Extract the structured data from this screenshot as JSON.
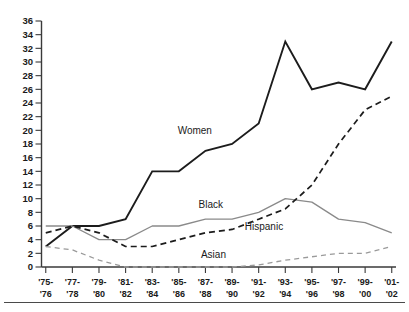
{
  "chart_data": {
    "type": "line",
    "title": "",
    "subtitle": "",
    "xlabel": "",
    "ylabel": "",
    "ylim": [
      0,
      36
    ],
    "ytick_step": 2,
    "grid": false,
    "legend_position": "inline-annotations",
    "categories": [
      "'75-\n'76",
      "'77-\n'78",
      "'79-\n'80",
      "'81-\n'82",
      "'83-\n'84",
      "'85-\n'86",
      "'87-\n'88",
      "'89-\n'90",
      "'91-\n'92",
      "'93-\n'94",
      "'95-\n'96",
      "'97-\n'98",
      "'99-\n'00",
      "'01-\n'02"
    ],
    "x_tick_top": [
      "'75-",
      "'77-",
      "'79-",
      "'81-",
      "'83-",
      "'85-",
      "'87-",
      "'89-",
      "'91-",
      "'93-",
      "'95-",
      "'97-",
      "'99-",
      "'01-"
    ],
    "x_tick_bottom": [
      "'76",
      "'78",
      "'80",
      "'82",
      "'84",
      "'86",
      "'88",
      "'90",
      "'92",
      "'94",
      "'96",
      "'98",
      "'00",
      "'02"
    ],
    "y_tick_labels": [
      "0",
      "2",
      "4",
      "6",
      "8",
      "10",
      "12",
      "14",
      "16",
      "18",
      "20",
      "22",
      "24",
      "26",
      "28",
      "30",
      "32",
      "34",
      "36"
    ],
    "y_tick_values": [
      0,
      2,
      4,
      6,
      8,
      10,
      12,
      14,
      16,
      18,
      20,
      22,
      24,
      26,
      28,
      30,
      32,
      34,
      36
    ],
    "series": [
      {
        "name": "Women",
        "style": "solid",
        "color": "#1c1c1c",
        "label_x_index": 5.6,
        "label_y_value": 19.4,
        "values": [
          3,
          6,
          6,
          7,
          14,
          14,
          17,
          18,
          21,
          33,
          26,
          27,
          26,
          33
        ]
      },
      {
        "name": "Black",
        "style": "solid",
        "color": "#8a8a8a",
        "label_x_index": 6.2,
        "label_y_value": 8.6,
        "values": [
          6,
          6,
          4,
          4,
          6,
          6,
          7,
          7,
          8,
          10,
          9.5,
          7,
          6.5,
          5
        ]
      },
      {
        "name": "Hispanic",
        "style": "dashed",
        "color": "#1c1c1c",
        "label_x_index": 8.2,
        "label_y_value": 5.4,
        "values": [
          5,
          6,
          5,
          3,
          3,
          4,
          5,
          5.5,
          7,
          8.5,
          12,
          18,
          23,
          25
        ]
      },
      {
        "name": "Asian",
        "style": "dashed",
        "color": "#9a9a9a",
        "label_x_index": 6.3,
        "label_y_value": 1.3,
        "values": [
          3,
          2.5,
          1,
          0,
          0,
          0,
          0,
          0,
          0.3,
          1,
          1.5,
          2,
          2,
          3
        ]
      }
    ]
  },
  "colors": {
    "background": "#ffffff",
    "axis": "#3a3a3a",
    "text": "#1a1a1a",
    "women": "#1c1c1c",
    "black": "#8a8a8a",
    "hispanic": "#1c1c1c",
    "asian": "#9a9a9a"
  }
}
